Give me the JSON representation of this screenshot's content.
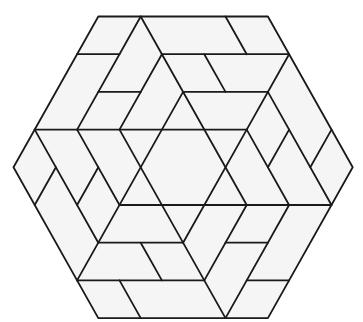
{
  "diagram": {
    "type": "hexagon-lattice-tiling",
    "lattice": {
      "rows": 8,
      "half_unit_columns": 16,
      "note": "points are [row, column] in lattice units; column counts half-units from the left vertex"
    },
    "colors": {
      "line": "#1a1a1a",
      "tile_fill": "#f5f5f5",
      "background": "#ffffff"
    },
    "outline": [
      [
        0,
        4
      ],
      [
        0,
        12
      ],
      [
        4,
        16
      ],
      [
        8,
        12
      ],
      [
        8,
        4
      ],
      [
        4,
        0
      ]
    ],
    "segments": [
      {
        "name": "horizontal-r1-left",
        "from": [
          1,
          3
        ],
        "to": [
          1,
          5
        ]
      },
      {
        "name": "horizontal-r1-right",
        "from": [
          1,
          7
        ],
        "to": [
          1,
          13
        ]
      },
      {
        "name": "horizontal-r2-left",
        "from": [
          2,
          4
        ],
        "to": [
          2,
          6
        ]
      },
      {
        "name": "horizontal-r2-right",
        "from": [
          2,
          8
        ],
        "to": [
          2,
          12
        ]
      },
      {
        "name": "horizontal-r3",
        "from": [
          3,
          1
        ],
        "to": [
          3,
          11
        ]
      },
      {
        "name": "horizontal-r5",
        "from": [
          5,
          5
        ],
        "to": [
          5,
          15
        ]
      },
      {
        "name": "horizontal-r6-left",
        "from": [
          6,
          4
        ],
        "to": [
          6,
          8
        ]
      },
      {
        "name": "horizontal-r6-right",
        "from": [
          6,
          10
        ],
        "to": [
          6,
          12
        ]
      },
      {
        "name": "horizontal-r7-left",
        "from": [
          7,
          3
        ],
        "to": [
          7,
          9
        ]
      },
      {
        "name": "horizontal-r7-right",
        "from": [
          7,
          11
        ],
        "to": [
          7,
          13
        ]
      },
      {
        "name": "slash-a",
        "from": [
          0,
          6
        ],
        "to": [
          3,
          3
        ]
      },
      {
        "name": "slash-b",
        "from": [
          1,
          7
        ],
        "to": [
          3,
          5
        ]
      },
      {
        "name": "slash-c",
        "from": [
          2,
          8
        ],
        "to": [
          7,
          3
        ]
      },
      {
        "name": "slash-d",
        "from": [
          1,
          13
        ],
        "to": [
          3,
          11
        ]
      },
      {
        "name": "slash-e",
        "from": [
          3,
          11
        ],
        "to": [
          6,
          8
        ]
      },
      {
        "name": "slash-f",
        "from": [
          4,
          2
        ],
        "to": [
          5,
          1
        ]
      },
      {
        "name": "slash-g",
        "from": [
          4,
          4
        ],
        "to": [
          5,
          3
        ]
      },
      {
        "name": "slash-h",
        "from": [
          3,
          13
        ],
        "to": [
          4,
          12
        ]
      },
      {
        "name": "slash-i",
        "from": [
          3,
          15
        ],
        "to": [
          4,
          14
        ]
      },
      {
        "name": "slash-j",
        "from": [
          5,
          11
        ],
        "to": [
          7,
          9
        ]
      },
      {
        "name": "slash-k",
        "from": [
          5,
          13
        ],
        "to": [
          8,
          10
        ]
      },
      {
        "name": "backslash-a",
        "from": [
          0,
          6
        ],
        "to": [
          5,
          11
        ]
      },
      {
        "name": "backslash-b",
        "from": [
          0,
          10
        ],
        "to": [
          1,
          11
        ]
      },
      {
        "name": "backslash-c",
        "from": [
          1,
          9
        ],
        "to": [
          2,
          10
        ]
      },
      {
        "name": "backslash-d",
        "from": [
          2,
          12
        ],
        "to": [
          5,
          15
        ]
      },
      {
        "name": "backslash-e",
        "from": [
          3,
          1
        ],
        "to": [
          6,
          4
        ]
      },
      {
        "name": "backslash-f",
        "from": [
          3,
          3
        ],
        "to": [
          5,
          5
        ]
      },
      {
        "name": "backslash-g",
        "from": [
          3,
          5
        ],
        "to": [
          8,
          10
        ]
      },
      {
        "name": "backslash-h",
        "from": [
          3,
          11
        ],
        "to": [
          5,
          13
        ]
      },
      {
        "name": "backslash-i",
        "from": [
          6,
          6
        ],
        "to": [
          7,
          7
        ]
      },
      {
        "name": "backslash-j",
        "from": [
          7,
          5
        ],
        "to": [
          8,
          6
        ]
      }
    ]
  }
}
